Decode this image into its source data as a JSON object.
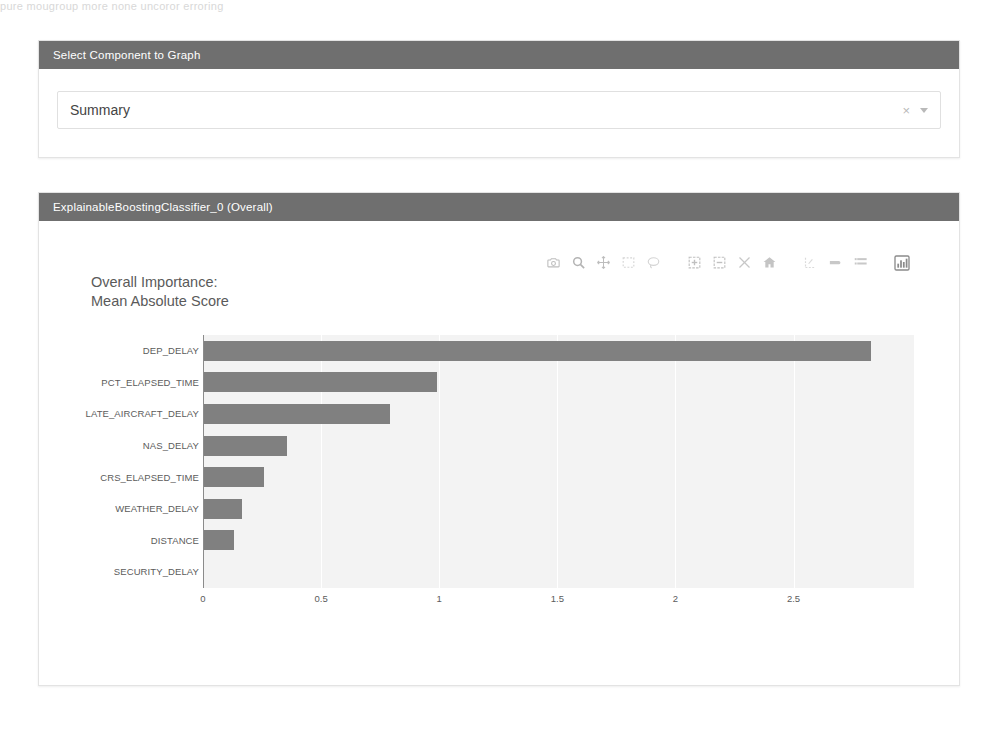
{
  "page": {
    "top_text_fragment": "pure mougroup more none uncoror erroring"
  },
  "select_panel": {
    "header": "Select Component to Graph",
    "dropdown": {
      "value": "Summary",
      "placeholder": "Summary",
      "clear_icon": "close-icon",
      "clear_label": "×",
      "caret_icon": "chevron-down-icon"
    }
  },
  "graph_panel": {
    "header": "ExplainableBoostingClassifier_0 (Overall)",
    "modebar": [
      {
        "name": "download-plot-png-icon",
        "title": "Download plot as a png"
      },
      {
        "name": "zoom-icon",
        "title": "Zoom"
      },
      {
        "name": "pan-icon",
        "title": "Pan"
      },
      {
        "name": "box-select-icon",
        "title": "Box Select"
      },
      {
        "name": "lasso-select-icon",
        "title": "Lasso Select"
      },
      {
        "name": "zoom-in-icon",
        "title": "Zoom in"
      },
      {
        "name": "zoom-out-icon",
        "title": "Zoom out"
      },
      {
        "name": "autoscale-icon",
        "title": "Autoscale"
      },
      {
        "name": "reset-axes-home-icon",
        "title": "Reset axes"
      },
      {
        "name": "toggle-spike-lines-icon",
        "title": "Toggle Spike Lines"
      },
      {
        "name": "hover-closest-icon",
        "title": "Show closest data on hover"
      },
      {
        "name": "hover-compare-icon",
        "title": "Compare data on hover"
      },
      {
        "name": "plotly-logo-icon",
        "title": "Produced with Plotly"
      }
    ]
  },
  "colors": {
    "panel_header_bg": "#6f6f6f",
    "panel_header_text": "#ffffff",
    "bar_fill": "#808080",
    "plot_bg": "#f3f3f3",
    "gridline": "#ffffff",
    "axis_text": "#5b5b5b",
    "title_text": "#5a5a5a",
    "card_border": "#e3e3e3"
  },
  "chart_data": {
    "type": "bar",
    "orientation": "horizontal",
    "title": "Overall Importance:\nMean Absolute Score",
    "xlabel": "",
    "ylabel": "",
    "categories": [
      "DEP_DELAY",
      "PCT_ELAPSED_TIME",
      "LATE_AIRCRAFT_DELAY",
      "NAS_DELAY",
      "CRS_ELAPSED_TIME",
      "WEATHER_DELAY",
      "DISTANCE",
      "SECURITY_DELAY"
    ],
    "values": [
      2.83,
      0.99,
      0.79,
      0.355,
      0.26,
      0.165,
      0.13,
      0.005
    ],
    "xlim": [
      0,
      3.01
    ],
    "xticks": [
      0,
      0.5,
      1,
      1.5,
      2,
      2.5
    ],
    "xticklabels": [
      "0",
      "0.5",
      "1",
      "1.5",
      "2",
      "2.5"
    ],
    "grid": true,
    "gridlines_x": [
      0.5,
      1,
      1.5,
      2,
      2.5
    ],
    "legend": false,
    "bar_color": "#808080"
  }
}
